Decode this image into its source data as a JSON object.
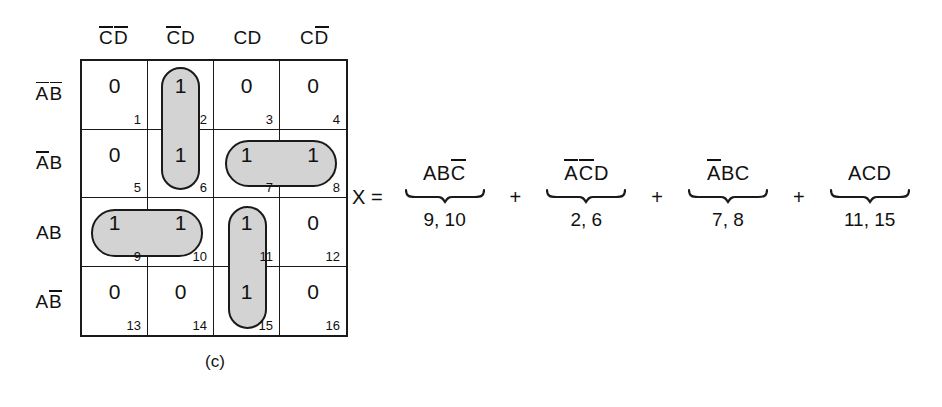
{
  "figure": {
    "caption": "(c)",
    "column_headers": [
      {
        "name": "c-bar-d-bar",
        "parts": [
          {
            "text": "C",
            "overline": true
          },
          {
            "text": "D",
            "overline": true
          }
        ]
      },
      {
        "name": "c-bar-d",
        "parts": [
          {
            "text": "C",
            "overline": true
          },
          {
            "text": "D",
            "overline": false
          }
        ]
      },
      {
        "name": "c-d",
        "parts": [
          {
            "text": "C",
            "overline": false
          },
          {
            "text": "D",
            "overline": false
          }
        ]
      },
      {
        "name": "c-d-bar",
        "parts": [
          {
            "text": "C",
            "overline": false
          },
          {
            "text": "D",
            "overline": true
          }
        ]
      }
    ],
    "row_headers": [
      {
        "name": "a-bar-b-bar",
        "parts": [
          {
            "text": "A",
            "overline": true
          },
          {
            "text": "B",
            "overline": true
          }
        ]
      },
      {
        "name": "a-bar-b",
        "parts": [
          {
            "text": "A",
            "overline": true
          },
          {
            "text": "B",
            "overline": false
          }
        ]
      },
      {
        "name": "a-b",
        "parts": [
          {
            "text": "A",
            "overline": false
          },
          {
            "text": "B",
            "overline": false
          }
        ]
      },
      {
        "name": "a-b-bar",
        "parts": [
          {
            "text": "A",
            "overline": false
          },
          {
            "text": "B",
            "overline": true
          }
        ]
      }
    ],
    "cells": [
      {
        "index": "1",
        "value": "0",
        "grouped": false
      },
      {
        "index": "2",
        "value": "1",
        "grouped": true
      },
      {
        "index": "3",
        "value": "0",
        "grouped": false
      },
      {
        "index": "4",
        "value": "0",
        "grouped": false
      },
      {
        "index": "5",
        "value": "0",
        "grouped": false
      },
      {
        "index": "6",
        "value": "1",
        "grouped": true
      },
      {
        "index": "7",
        "value": "1",
        "grouped": true
      },
      {
        "index": "8",
        "value": "1",
        "grouped": true
      },
      {
        "index": "9",
        "value": "1",
        "grouped": true
      },
      {
        "index": "10",
        "value": "1",
        "grouped": true
      },
      {
        "index": "11",
        "value": "1",
        "grouped": true
      },
      {
        "index": "12",
        "value": "0",
        "grouped": false
      },
      {
        "index": "13",
        "value": "0",
        "grouped": false
      },
      {
        "index": "14",
        "value": "0",
        "grouped": false
      },
      {
        "index": "15",
        "value": "1",
        "grouped": true
      },
      {
        "index": "16",
        "value": "0",
        "grouped": false
      }
    ],
    "groups": [
      {
        "name": "group-2-6",
        "cells": [
          "2",
          "6"
        ],
        "orientation": "vertical",
        "col": 1,
        "row": 0,
        "span_cols": 1,
        "span_rows": 2
      },
      {
        "name": "group-7-8",
        "cells": [
          "7",
          "8"
        ],
        "orientation": "horizontal",
        "col": 2,
        "row": 1,
        "span_cols": 2,
        "span_rows": 1
      },
      {
        "name": "group-9-10",
        "cells": [
          "9",
          "10"
        ],
        "orientation": "horizontal",
        "col": 0,
        "row": 2,
        "span_cols": 2,
        "span_rows": 1
      },
      {
        "name": "group-11-15",
        "cells": [
          "11",
          "15"
        ],
        "orientation": "vertical",
        "col": 2,
        "row": 2,
        "span_cols": 1,
        "span_rows": 2
      }
    ],
    "shading_color": "#d3d3d3",
    "line_color": "#1a1a1a"
  },
  "equation": {
    "lhs": "X =",
    "plus": "+",
    "terms": [
      {
        "name": "term-abc-bar",
        "parts": [
          {
            "text": "A",
            "overline": false
          },
          {
            "text": "B",
            "overline": false
          },
          {
            "text": "C",
            "overline": true
          }
        ],
        "minterms": "9, 10"
      },
      {
        "name": "term-a-bar-c-bar-d",
        "parts": [
          {
            "text": "A",
            "overline": true
          },
          {
            "text": "C",
            "overline": true
          },
          {
            "text": "D",
            "overline": false
          }
        ],
        "minterms": "2, 6"
      },
      {
        "name": "term-a-bar-bc",
        "parts": [
          {
            "text": "A",
            "overline": true
          },
          {
            "text": "B",
            "overline": false
          },
          {
            "text": "C",
            "overline": false
          }
        ],
        "minterms": "7, 8"
      },
      {
        "name": "term-acd",
        "parts": [
          {
            "text": "A",
            "overline": false
          },
          {
            "text": "C",
            "overline": false
          },
          {
            "text": "D",
            "overline": false
          }
        ],
        "minterms": "11, 15"
      }
    ]
  }
}
